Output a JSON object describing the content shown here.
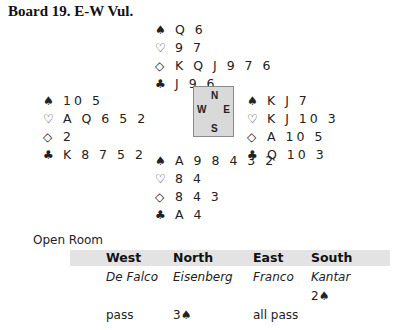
{
  "title": "Board 19.  E-W Vul.",
  "suit_symbols": {
    "spades": "♠",
    "hearts": "♡",
    "diamonds": "◇",
    "clubs": "♣"
  },
  "hands": {
    "north": {
      "spades": "Q 6",
      "hearts": "9 7",
      "diamonds": "K Q J 9 7 6",
      "clubs": "J 9 6"
    },
    "west": {
      "spades": "10 5",
      "hearts": "A Q 6 5 2",
      "diamonds": "2",
      "clubs": "K 8 7 5 2"
    },
    "east": {
      "spades": "K J 7",
      "hearts": "K J 10 3",
      "diamonds": "A 10 5",
      "clubs": "Q 10 3"
    },
    "south": {
      "spades": "A 9 8 4 3 2",
      "hearts": "8 4",
      "diamonds": "8 4 3",
      "clubs": "A 4"
    }
  },
  "compass": {
    "n": "N",
    "w": "W",
    "e": "E",
    "s": "S"
  },
  "room_label": "Open Room",
  "bidding": {
    "headers": [
      "West",
      "North",
      "East",
      "South"
    ],
    "players": [
      "De Falco",
      "Eisenberg",
      "Franco",
      "Kantar"
    ],
    "rounds": [
      [
        "",
        "",
        "",
        "2♠"
      ],
      [
        "pass",
        "3♠",
        "all pass",
        ""
      ]
    ]
  }
}
